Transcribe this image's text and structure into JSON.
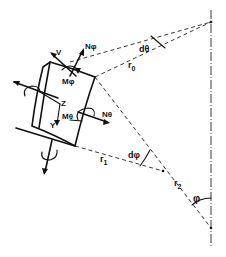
{
  "figure": {
    "colors": {
      "ink": "#111111",
      "background": "#ffffff"
    }
  },
  "labels": {
    "V": "V",
    "N_phi": "Nφ",
    "M_phi": "Mφ",
    "Z": "Z",
    "Y": "Y",
    "M_theta": "Mθ",
    "N_theta": "Nθ",
    "d_theta": "dθ",
    "r0": "r",
    "r0_sub": "0",
    "r1": "r",
    "r1_sub": "1",
    "r2": "r",
    "r2_sub": "2",
    "d_phi": "dφ",
    "phi": "φ"
  }
}
